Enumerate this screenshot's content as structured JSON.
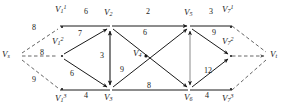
{
  "figure": {
    "type": "network-flow-graph",
    "stroke_color": "#1a1a1a",
    "dashed_color": "#555555",
    "background": "#ffffff"
  },
  "nodes": [
    {
      "id": "Vs",
      "base": "V",
      "sub": "s",
      "sup": "",
      "x": 14,
      "y": 56,
      "label_x": 2,
      "label_y": 50
    },
    {
      "id": "V11",
      "base": "V",
      "sub": "1",
      "sup": "1",
      "x": 63,
      "y": 26,
      "label_x": 55,
      "label_y": 5
    },
    {
      "id": "V12",
      "base": "V",
      "sub": "1",
      "sup": "2",
      "x": 63,
      "y": 56,
      "label_x": 55,
      "label_y": 36
    },
    {
      "id": "V13",
      "base": "V",
      "sub": "1",
      "sup": "3",
      "x": 63,
      "y": 90,
      "label_x": 55,
      "label_y": 92
    },
    {
      "id": "V2",
      "base": "V",
      "sub": "2",
      "sup": "",
      "x": 110,
      "y": 26,
      "label_x": 104,
      "label_y": 6
    },
    {
      "id": "V3",
      "base": "V",
      "sub": "3",
      "sup": "",
      "x": 110,
      "y": 90,
      "label_x": 104,
      "label_y": 92
    },
    {
      "id": "V4",
      "base": "V",
      "sub": "4",
      "sup": "",
      "x": 146,
      "y": 56,
      "label_x": 133,
      "label_y": 49
    },
    {
      "id": "V5",
      "base": "V",
      "sub": "5",
      "sup": "",
      "x": 190,
      "y": 26,
      "label_x": 184,
      "label_y": 6
    },
    {
      "id": "V6",
      "base": "V",
      "sub": "6",
      "sup": "",
      "x": 190,
      "y": 90,
      "label_x": 184,
      "label_y": 92
    },
    {
      "id": "V71",
      "base": "V",
      "sub": "7",
      "sup": "1",
      "x": 228,
      "y": 26,
      "label_x": 221,
      "label_y": 5
    },
    {
      "id": "V72",
      "base": "V",
      "sub": "7",
      "sup": "2",
      "x": 228,
      "y": 56,
      "label_x": 221,
      "label_y": 36
    },
    {
      "id": "V73",
      "base": "V",
      "sub": "7",
      "sup": "3",
      "x": 228,
      "y": 90,
      "label_x": 221,
      "label_y": 92
    },
    {
      "id": "Vt",
      "base": "V",
      "sub": "t",
      "sup": "",
      "x": 272,
      "y": 56,
      "label_x": 268,
      "label_y": 50
    }
  ],
  "edges": [
    {
      "from": "Vs",
      "to": "V11",
      "weight": "8",
      "style": "dashed",
      "arrow": "none",
      "label_x": 33,
      "label_y": 26
    },
    {
      "from": "Vs",
      "to": "V12",
      "weight": "8",
      "style": "dashed",
      "arrow": "none",
      "label_x": 38,
      "label_y": 48
    },
    {
      "from": "Vs",
      "to": "V13",
      "weight": "9",
      "style": "dashed",
      "arrow": "none",
      "label_x": 33,
      "label_y": 78
    },
    {
      "from": "V11",
      "to": "V2",
      "weight": "6",
      "style": "solid",
      "arrow": "none",
      "label_x": 83,
      "label_y": 6
    },
    {
      "from": "V12",
      "to": "V2",
      "weight": "7",
      "style": "solid",
      "arrow": "forward",
      "label_x": 82,
      "label_y": 32
    },
    {
      "from": "V12",
      "to": "V3",
      "weight": "6",
      "style": "solid",
      "arrow": "forward",
      "label_x": 76,
      "label_y": 72
    },
    {
      "from": "V13",
      "to": "V3",
      "weight": "4",
      "style": "solid",
      "arrow": "none",
      "label_x": 83,
      "label_y": 92
    },
    {
      "from": "V2",
      "to": "V3",
      "weight": "3",
      "style": "solid",
      "arrow": "both",
      "label_x": 100,
      "label_y": 53
    },
    {
      "from": "V2",
      "to": "V5",
      "weight": "2",
      "style": "solid",
      "arrow": "forward",
      "label_x": 147,
      "label_y": 6
    },
    {
      "from": "V2",
      "to": "V6",
      "weight": "6",
      "style": "solid",
      "arrow": "forward",
      "label_x": 144,
      "label_y": 30
    },
    {
      "from": "V3",
      "to": "V5",
      "weight": "9",
      "style": "solid",
      "arrow": "forward",
      "label_x": 122,
      "label_y": 66
    },
    {
      "from": "V3",
      "to": "V6",
      "weight": "8",
      "style": "solid",
      "arrow": "none",
      "label_x": 147,
      "label_y": 85
    },
    {
      "from": "V5",
      "to": "V6",
      "weight": "",
      "style": "solid",
      "arrow": "both",
      "label_x": 180,
      "label_y": 53
    },
    {
      "from": "V5",
      "to": "V71",
      "weight": "3",
      "style": "solid",
      "arrow": "none",
      "label_x": 209,
      "label_y": 6
    },
    {
      "from": "V5",
      "to": "V72",
      "weight": "9",
      "style": "solid",
      "arrow": "forward",
      "label_x": 211,
      "label_y": 30
    },
    {
      "from": "V6",
      "to": "V72",
      "weight": "12",
      "style": "solid",
      "arrow": "forward",
      "label_x": 206,
      "label_y": 68
    },
    {
      "from": "V6",
      "to": "V73",
      "weight": "4",
      "style": "solid",
      "arrow": "none",
      "label_x": 206,
      "label_y": 92
    },
    {
      "from": "V71",
      "to": "Vt",
      "weight": "",
      "style": "dashed",
      "arrow": "none",
      "label_x": 0,
      "label_y": 0
    },
    {
      "from": "V72",
      "to": "Vt",
      "weight": "",
      "style": "dashed",
      "arrow": "forward",
      "label_x": 0,
      "label_y": 0
    },
    {
      "from": "V73",
      "to": "Vt",
      "weight": "",
      "style": "dashed",
      "arrow": "none",
      "label_x": 0,
      "label_y": 0
    }
  ]
}
